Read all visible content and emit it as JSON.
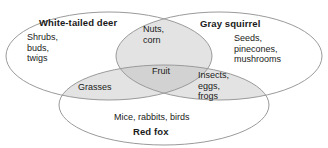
{
  "diagram": {
    "type": "venn-3-set",
    "canvas": {
      "width": 328,
      "height": 148
    },
    "colors": {
      "background": "#ffffff",
      "outline": "#9a9a9a",
      "fill_pairwise": "#e3e3e3",
      "fill_center": "#d2d2d2",
      "text": "#1a1a1a"
    },
    "sets": [
      {
        "id": "deer",
        "label": "White-tailed deer",
        "position": "left",
        "exclusive_items": "Shrubs,\nbuds,\ntwigs"
      },
      {
        "id": "squirrel",
        "label": "Gray squirrel",
        "position": "right",
        "exclusive_items": "Seeds,\npinecones,\nmushrooms"
      },
      {
        "id": "fox",
        "label": "Red fox",
        "position": "bottom",
        "exclusive_items": "Mice, rabbits, birds"
      }
    ],
    "intersections": [
      {
        "id": "deer-squirrel",
        "sets": [
          "deer",
          "squirrel"
        ],
        "items": "Nuts,\ncorn"
      },
      {
        "id": "deer-fox",
        "sets": [
          "deer",
          "fox"
        ],
        "items": "Grasses"
      },
      {
        "id": "squirrel-fox",
        "sets": [
          "squirrel",
          "fox"
        ],
        "items": "Insects,\neggs,\nfrogs"
      },
      {
        "id": "all-three",
        "sets": [
          "deer",
          "squirrel",
          "fox"
        ],
        "items": "Fruit"
      }
    ]
  }
}
